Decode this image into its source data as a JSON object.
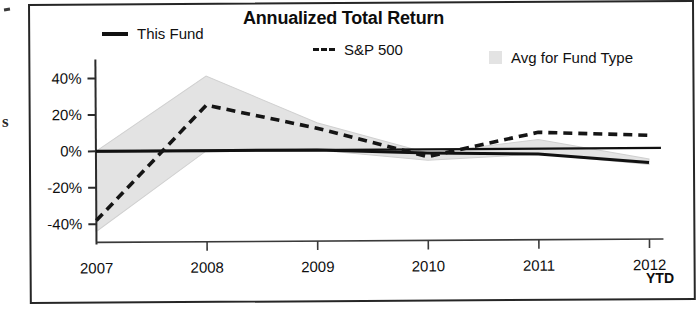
{
  "chart_data": {
    "type": "line",
    "title": "Annualized Total Return",
    "xlabel": "YTD",
    "ylabel": "",
    "x": [
      "2007",
      "2008",
      "2009",
      "2010",
      "2011",
      "2012"
    ],
    "categories": [
      "2007",
      "2008",
      "2009",
      "2010",
      "2011",
      "2012"
    ],
    "ylim": [
      -50,
      45
    ],
    "yticks": [
      40,
      20,
      0,
      -20,
      -40
    ],
    "ytick_labels": [
      "40%",
      "20%",
      "0%",
      "-20%",
      "-40%"
    ],
    "grid": false,
    "legend_position": "top",
    "series": [
      {
        "name": "This Fund",
        "style": "solid",
        "color": "#111111",
        "values": [
          0,
          0,
          0,
          -2,
          -3,
          -8
        ]
      },
      {
        "name": "S&P 500",
        "style": "dashed",
        "color": "#151515",
        "values": [
          -38,
          25,
          12,
          -4,
          9,
          7
        ]
      },
      {
        "name": "Avg for Fund Type",
        "style": "area",
        "color": "#e3e3e3",
        "upper": [
          0,
          41,
          15,
          -2,
          5,
          -6
        ],
        "lower": [
          -44,
          0,
          0,
          -6,
          -3,
          -9
        ]
      }
    ],
    "annotations": []
  },
  "chart": {
    "title": "Annualized Total Return",
    "legend": [
      {
        "key": "this-fund",
        "label": "This Fund",
        "marker": "solid-line-icon"
      },
      {
        "key": "sp500",
        "label": "S&P 500",
        "marker": "dashed-line-icon"
      },
      {
        "key": "avg-fund-type",
        "label": "Avg for Fund Type",
        "marker": "area-swatch-icon"
      }
    ],
    "y_axis": {
      "labels": [
        "40%",
        "20%",
        "0%",
        "-20%",
        "-40%"
      ]
    },
    "x_axis": {
      "labels": [
        "2007",
        "2008",
        "2009",
        "2010",
        "2011",
        "2012"
      ],
      "unit_label": "YTD"
    }
  },
  "artifacts": {
    "margin_letter": "s"
  }
}
